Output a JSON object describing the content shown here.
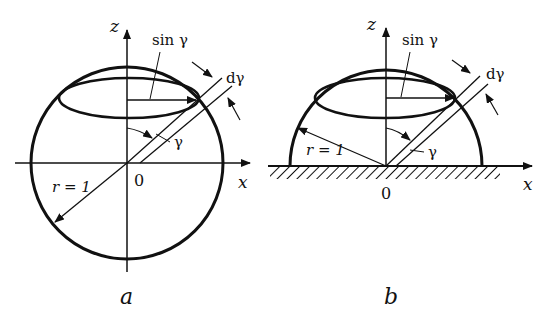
{
  "figure": {
    "panels": [
      {
        "id": "a",
        "caption": "a",
        "description": "Full sphere of radius r = 1 centered at origin 0, with latitude ring at polar angle gamma",
        "labels": {
          "z_axis": "z",
          "x_axis": "x",
          "origin": "0",
          "radius": "r = 1",
          "ring_radius": "sin γ",
          "angle": "γ",
          "angle_increment": "dγ"
        }
      },
      {
        "id": "b",
        "caption": "b",
        "description": "Hemisphere of radius r = 1 resting on a hatched surface, with latitude ring at polar angle gamma",
        "labels": {
          "z_axis": "z",
          "x_axis": "x",
          "origin": "0",
          "radius": "r = 1",
          "ring_radius": "sin γ",
          "angle": "γ",
          "angle_increment": "dγ"
        }
      }
    ],
    "colors": {
      "ink": "#111111",
      "background": "#ffffff"
    }
  }
}
